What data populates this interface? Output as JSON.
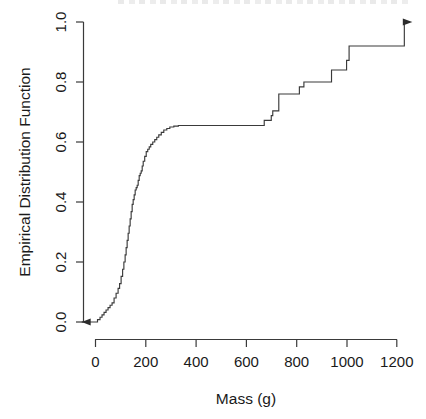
{
  "chart_data": {
    "type": "line",
    "subtype": "ecdf-step",
    "title": "",
    "xlabel": "Mass (g)",
    "ylabel": "Empirical Distribution Function",
    "xlim": [
      -60,
      1265
    ],
    "ylim": [
      0.0,
      1.0
    ],
    "grid": false,
    "legend": null,
    "xticks": [
      0,
      200,
      400,
      600,
      800,
      1000,
      1200
    ],
    "xtick_labels": [
      "0",
      "200",
      "400",
      "600",
      "800",
      "1000",
      "1200"
    ],
    "yticks": [
      0.0,
      0.2,
      0.4,
      0.6,
      0.8,
      1.0
    ],
    "ytick_labels": [
      "0.0",
      "0.2",
      "0.4",
      "0.6",
      "0.8",
      "1.0"
    ],
    "annotations": [
      {
        "name": "left-arrow",
        "description": "arrow extending left at F=0.0 from x=0 to plot edge"
      },
      {
        "name": "right-arrow",
        "description": "arrow extending right at F=1.0 from x=1060 to x=1230"
      }
    ],
    "series": [
      {
        "name": "Empirical CDF of Mass",
        "step_type": "hv",
        "x": [
          -55,
          0,
          8,
          18,
          26,
          34,
          42,
          50,
          58,
          66,
          74,
          82,
          90,
          96,
          102,
          108,
          113,
          118,
          122,
          126,
          130,
          134,
          138,
          142,
          146,
          150,
          154,
          158,
          162,
          166,
          170,
          174,
          178,
          182,
          186,
          190,
          196,
          202,
          208,
          214,
          220,
          228,
          236,
          244,
          252,
          262,
          272,
          284,
          296,
          312,
          330,
          650,
          672,
          700,
          706,
          730,
          770,
          812,
          830,
          880,
          940,
          1000,
          1010,
          1060,
          1230
        ],
        "y": [
          0.0,
          0.0,
          0.008,
          0.016,
          0.024,
          0.032,
          0.04,
          0.048,
          0.056,
          0.064,
          0.08,
          0.096,
          0.112,
          0.128,
          0.152,
          0.176,
          0.2,
          0.224,
          0.248,
          0.272,
          0.296,
          0.32,
          0.344,
          0.368,
          0.392,
          0.408,
          0.424,
          0.44,
          0.448,
          0.456,
          0.472,
          0.488,
          0.496,
          0.504,
          0.52,
          0.536,
          0.552,
          0.568,
          0.576,
          0.584,
          0.592,
          0.6,
          0.608,
          0.616,
          0.624,
          0.632,
          0.64,
          0.645,
          0.65,
          0.653,
          0.655,
          0.655,
          0.672,
          0.688,
          0.704,
          0.76,
          0.76,
          0.784,
          0.8,
          0.8,
          0.84,
          0.872,
          0.92,
          0.92,
          1.0
        ]
      }
    ]
  },
  "axes": {
    "y_title": "Empirical Distribution Function",
    "x_title": "Mass (g)",
    "y_labels": [
      "0.0",
      "0.2",
      "0.4",
      "0.6",
      "0.8",
      "1.0"
    ],
    "x_labels": [
      "0",
      "200",
      "400",
      "600",
      "800",
      "1000",
      "1200"
    ]
  },
  "style": {
    "line_color": "#3a3a3a",
    "axis_color": "#3a3a3a",
    "text_color": "#1a1a1a",
    "background": "#ffffff"
  }
}
